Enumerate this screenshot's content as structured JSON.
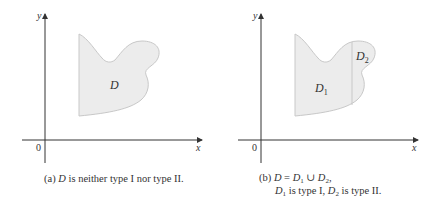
{
  "panel_a": {
    "axis_x_label": "x",
    "axis_y_label": "y",
    "origin_label": "0",
    "region_label": "D",
    "caption_prefix": "(a) ",
    "caption_var": "D",
    "caption_text": " is neither type I nor type II."
  },
  "panel_b": {
    "axis_x_label": "x",
    "axis_y_label": "y",
    "origin_label": "0",
    "region1_label": "D",
    "region1_sub": "1",
    "region2_label": "D",
    "region2_sub": "2",
    "caption_line1_prefix": "(b) ",
    "caption_line1_D": "D",
    "caption_line1_eq": " = ",
    "caption_line1_D1": "D",
    "caption_line1_sub1": "1",
    "caption_line1_union": " ∪ ",
    "caption_line1_D2": "D",
    "caption_line1_sub2": "2",
    "caption_line1_end": ",",
    "caption_line2_D1": "D",
    "caption_line2_sub1": "1",
    "caption_line2_mid": " is type I, ",
    "caption_line2_D2": "D",
    "caption_line2_sub2": "2",
    "caption_line2_end": " is type II."
  },
  "colors": {
    "region_fill": "#ececec",
    "region_stroke": "#c8c8c8",
    "axis": "#333333"
  }
}
